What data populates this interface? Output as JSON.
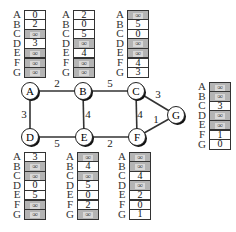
{
  "diagram": {
    "type": "network-graph-with-distance-tables",
    "nodes": [
      {
        "id": "A",
        "label": "A",
        "x": 30,
        "y": 91
      },
      {
        "id": "B",
        "label": "B",
        "x": 83,
        "y": 91
      },
      {
        "id": "C",
        "label": "C",
        "x": 136,
        "y": 91
      },
      {
        "id": "D",
        "label": "D",
        "x": 30,
        "y": 137
      },
      {
        "id": "E",
        "label": "E",
        "x": 84,
        "y": 137
      },
      {
        "id": "F",
        "label": "F",
        "x": 137,
        "y": 137
      },
      {
        "id": "G",
        "label": "G",
        "x": 176,
        "y": 115
      }
    ],
    "edges": [
      {
        "from": "A",
        "to": "B",
        "weight": "2",
        "lx": 57,
        "ly": 87
      },
      {
        "from": "B",
        "to": "C",
        "weight": "5",
        "lx": 110,
        "ly": 87
      },
      {
        "from": "A",
        "to": "D",
        "weight": "3",
        "lx": 24,
        "ly": 118
      },
      {
        "from": "B",
        "to": "E",
        "weight": "4",
        "lx": 88,
        "ly": 118
      },
      {
        "from": "C",
        "to": "F",
        "weight": "4",
        "lx": 140,
        "ly": 118
      },
      {
        "from": "D",
        "to": "E",
        "weight": "5",
        "lx": 57,
        "ly": 147
      },
      {
        "from": "E",
        "to": "F",
        "weight": "2",
        "lx": 110,
        "ly": 147
      },
      {
        "from": "C",
        "to": "G",
        "weight": "3",
        "lx": 158,
        "ly": 98
      },
      {
        "from": "F",
        "to": "G",
        "weight": "1",
        "lx": 156,
        "ly": 123
      }
    ],
    "row_labels": [
      "A",
      "B",
      "C",
      "D",
      "E",
      "F",
      "G"
    ],
    "tables": [
      {
        "node": "A",
        "left": 12,
        "top": 10,
        "values": [
          "0",
          "2",
          "∞",
          "3",
          "∞",
          "∞",
          "∞"
        ]
      },
      {
        "node": "B",
        "left": 61,
        "top": 10,
        "values": [
          "2",
          "0",
          "5",
          "∞",
          "4",
          "∞",
          "∞"
        ]
      },
      {
        "node": "C",
        "left": 115,
        "top": 10,
        "values": [
          "∞",
          "5",
          "0",
          "∞",
          "∞",
          "4",
          "3"
        ]
      },
      {
        "node": "G",
        "left": 197,
        "top": 82,
        "values": [
          "∞",
          "∞",
          "3",
          "∞",
          "∞",
          "1",
          "0"
        ]
      },
      {
        "node": "D",
        "left": 12,
        "top": 152,
        "values": [
          "3",
          "∞",
          "∞",
          "0",
          "5",
          "∞",
          "∞"
        ]
      },
      {
        "node": "E",
        "left": 65,
        "top": 152,
        "values": [
          "∞",
          "4",
          "∞",
          "5",
          "0",
          "2",
          "∞"
        ]
      },
      {
        "node": "F",
        "left": 117,
        "top": 152,
        "values": [
          "∞",
          "∞",
          "4",
          "∞",
          "2",
          "0",
          "1"
        ]
      }
    ],
    "colors": {
      "edge": "#333333",
      "node_fill": "#ffffff",
      "node_stroke": "#222222",
      "node_shadow": "#111111",
      "infinity_cell": "#b4b4b4"
    }
  }
}
